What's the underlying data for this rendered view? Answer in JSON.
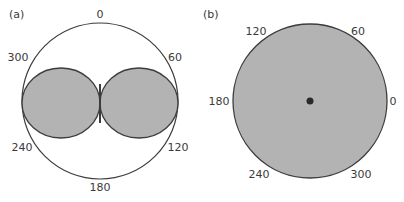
{
  "panels": [
    {
      "label": "(a)",
      "angle_labels": {
        "a0": "0",
        "a60": "60",
        "a120": "120",
        "a180": "180",
        "a240": "240",
        "a300": "300"
      }
    },
    {
      "label": "(b)",
      "angle_labels": {
        "a0": "0",
        "a60": "60",
        "a120": "120",
        "a180": "180",
        "a240": "240",
        "a300": "300"
      }
    }
  ],
  "colors": {
    "fill": "#b3b3b3",
    "stroke": "#3c3c3c",
    "dot": "#2a2a2a"
  }
}
